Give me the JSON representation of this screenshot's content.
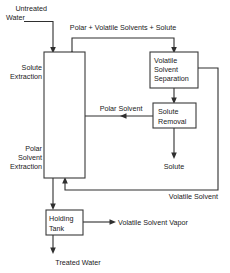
{
  "diagram": {
    "colors": {
      "line": "#2f2f2f",
      "box_stroke": "#3a3a3a",
      "box_fill": "#ffffff",
      "text": "#1a1a1a",
      "background": "#ffffff"
    },
    "boxes": [
      {
        "id": "extraction-column",
        "lines": [
          "Solute",
          "Extraction",
          "Polar",
          "Solvent",
          "Extraction"
        ]
      },
      {
        "id": "volatile-solvent-separation",
        "lines": [
          "Volatile",
          "Solvent",
          "Separation"
        ]
      },
      {
        "id": "solute-removal",
        "lines": [
          "Solute",
          "Removal"
        ]
      },
      {
        "id": "holding-tank",
        "lines": [
          "Holding",
          "Tank"
        ]
      }
    ],
    "labels": {
      "untreated_water_1": "Untreated",
      "untreated_water_2": "Water",
      "solute_extraction_1": "Solute",
      "solute_extraction_2": "Extraction",
      "polar_solvent_extraction_1": "Polar",
      "polar_solvent_extraction_2": "Solvent",
      "polar_solvent_extraction_3": "Extraction",
      "recycle_stream": "Polar + Volatile Solvents + Solute",
      "volatile_solvent_separation_1": "Volatile",
      "volatile_solvent_separation_2": "Solvent",
      "volatile_solvent_separation_3": "Separation",
      "polar_solvent": "Polar Solvent",
      "solute_removal_1": "Solute",
      "solute_removal_2": "Removal",
      "solute_output": "Solute",
      "volatile_solvent_return": "Volatile Solvent",
      "holding_tank_1": "Holding",
      "holding_tank_2": "Tank",
      "volatile_solvent_vapor": "Volatile Solvent Vapor",
      "treated_water": "Treated Water"
    }
  }
}
